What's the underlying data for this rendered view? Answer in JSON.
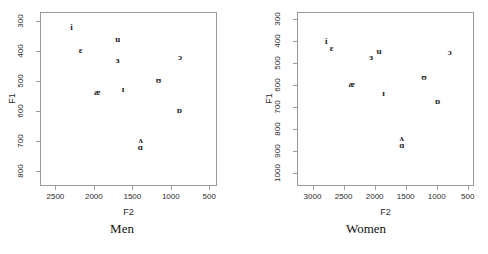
{
  "chart_data": [
    {
      "type": "scatter",
      "title": "Men",
      "xlabel": "F2",
      "ylabel": "F1",
      "xlim": [
        2700,
        400
      ],
      "ylim": [
        850,
        270
      ],
      "x_ticks": [
        2500,
        2000,
        1500,
        1000,
        500
      ],
      "y_ticks": [
        300,
        400,
        500,
        600,
        700,
        800
      ],
      "x_reversed": true,
      "y_reversed": true,
      "grid": false,
      "legend": "none",
      "points": [
        {
          "label": "i",
          "F2": 2290,
          "F1": 320
        },
        {
          "label": "ɛ",
          "F2": 2170,
          "F1": 395
        },
        {
          "label": "u",
          "F2": 1690,
          "F1": 360
        },
        {
          "label": "ɜ",
          "F2": 1690,
          "F1": 430
        },
        {
          "label": "ɔ",
          "F2": 880,
          "F1": 420
        },
        {
          "label": "ʊ",
          "F2": 1160,
          "F1": 495
        },
        {
          "label": "ɪ",
          "F2": 1620,
          "F1": 525
        },
        {
          "label": "æ",
          "F2": 1955,
          "F1": 535
        },
        {
          "label": "ɒ",
          "F2": 890,
          "F1": 595
        },
        {
          "label": "ʌ",
          "F2": 1390,
          "F1": 695
        },
        {
          "label": "ɑ",
          "F2": 1395,
          "F1": 720
        }
      ]
    },
    {
      "type": "scatter",
      "title": "Women",
      "xlabel": "F2",
      "ylabel": "F1",
      "xlim": [
        3250,
        400
      ],
      "ylim": [
        1060,
        270
      ],
      "x_ticks": [
        3000,
        2500,
        2000,
        1500,
        1000,
        500
      ],
      "y_ticks": [
        300,
        400,
        500,
        600,
        700,
        800,
        900,
        1000
      ],
      "x_reversed": true,
      "y_reversed": true,
      "grid": false,
      "legend": "none",
      "points": [
        {
          "label": "i",
          "F2": 2780,
          "F1": 400
        },
        {
          "label": "ɛ",
          "F2": 2690,
          "F1": 435
        },
        {
          "label": "u",
          "F2": 1930,
          "F1": 445
        },
        {
          "label": "ɜ",
          "F2": 2055,
          "F1": 475
        },
        {
          "label": "ɔ",
          "F2": 790,
          "F1": 450
        },
        {
          "label": "ʊ",
          "F2": 1205,
          "F1": 565
        },
        {
          "label": "æ",
          "F2": 2370,
          "F1": 595
        },
        {
          "label": "ɪ",
          "F2": 1855,
          "F1": 640
        },
        {
          "label": "ɒ",
          "F2": 985,
          "F1": 675
        },
        {
          "label": "ʌ",
          "F2": 1565,
          "F1": 840
        },
        {
          "label": "ɑ",
          "F2": 1560,
          "F1": 875
        }
      ]
    }
  ],
  "panels": [
    {
      "caption": "Men",
      "xlabel": "F2",
      "ylabel": "F1"
    },
    {
      "caption": "Women",
      "xlabel": "F2",
      "ylabel": "F1"
    }
  ]
}
